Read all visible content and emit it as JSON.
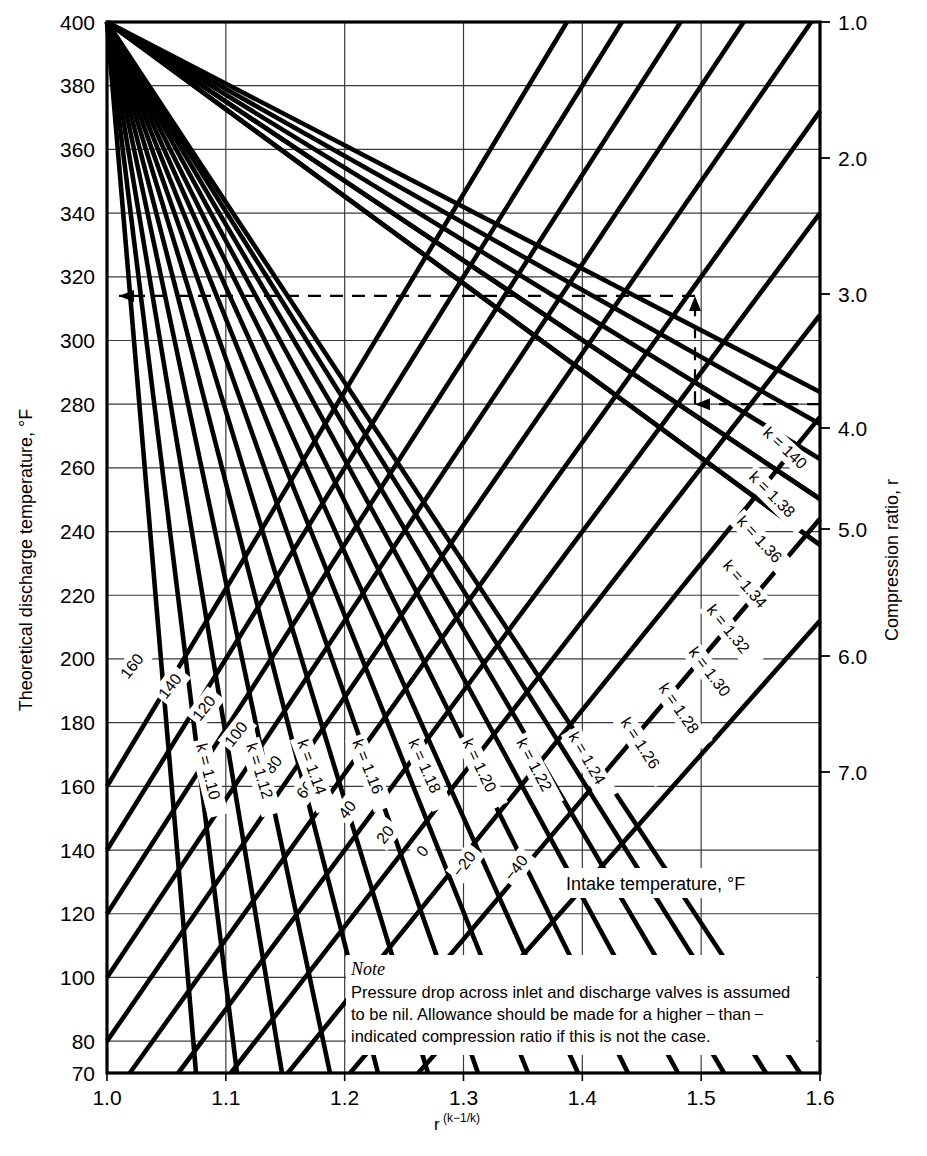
{
  "figure": {
    "kind": "nomograph",
    "background": "#ffffff",
    "line_color": "#000000",
    "grid_color": "#3a3a3a"
  },
  "axes": {
    "left": {
      "title": "Theoretical discharge temperature, °F",
      "ticks": [
        70,
        80,
        100,
        120,
        140,
        160,
        180,
        200,
        220,
        240,
        260,
        280,
        300,
        320,
        340,
        360,
        380,
        400
      ],
      "min": 70,
      "max": 400
    },
    "bottom": {
      "title_base": "r",
      "title_sup": "(k−1/k)",
      "ticks": [
        "1.0",
        "1.1",
        "1.2",
        "1.3",
        "1.4",
        "1.5",
        "1.6"
      ],
      "min": 1.0,
      "max": 1.6
    },
    "right": {
      "title": "Compression ratio, r",
      "ticks": [
        "1.0",
        "2.0",
        "3.0",
        "4.0",
        "5.0",
        "6.0",
        "7.0"
      ],
      "tick_values": [
        1.0,
        2.0,
        3.0,
        4.0,
        5.0,
        6.0,
        7.0
      ]
    }
  },
  "chart_data": {
    "type": "line",
    "xlabel": "r (k-1/k)",
    "ylabel": "Theoretical discharge temperature, °F",
    "xlim": [
      1.0,
      1.6
    ],
    "ylim": [
      70,
      400
    ],
    "grid": true,
    "legend": "inline curve labels",
    "k_lines": {
      "label_prefix": "k = ",
      "description": "Descending fan of k-lines converging at (1.0, 400) mapping r to r^((k-1)/k)",
      "series": [
        {
          "name": "k = 1.10",
          "k": 1.1,
          "label": "k = 1.10"
        },
        {
          "name": "k = 1.12",
          "k": 1.12,
          "label": "k = 1.12"
        },
        {
          "name": "k = 1.14",
          "k": 1.14,
          "label": "k = 1.14"
        },
        {
          "name": "k = 1.16",
          "k": 1.16,
          "label": "k = 1.16"
        },
        {
          "name": "k = 1.18",
          "k": 1.18,
          "label": "k = 1.18"
        },
        {
          "name": "k = 1.20",
          "k": 1.2,
          "label": "k = 1.20"
        },
        {
          "name": "k = 1.22",
          "k": 1.22,
          "label": "k = 1.22"
        },
        {
          "name": "k = 1.24",
          "k": 1.24,
          "label": "k = 1.24"
        },
        {
          "name": "k = 1.26",
          "k": 1.26,
          "label": "k = 1.26"
        },
        {
          "name": "k = 1.28",
          "k": 1.28,
          "label": "k = 1.28"
        },
        {
          "name": "k = 1.30",
          "k": 1.3,
          "label": "k = 1.30"
        },
        {
          "name": "k = 1.32",
          "k": 1.32,
          "label": "k = 1.32"
        },
        {
          "name": "k = 1.34",
          "k": 1.34,
          "label": "k = 1.34"
        },
        {
          "name": "k = 1.36",
          "k": 1.36,
          "label": "k = 1.36"
        },
        {
          "name": "k = 1.38",
          "k": 1.38,
          "label": "k = 1.38"
        },
        {
          "name": "k = 140",
          "k": 1.4,
          "label": "k = 140"
        }
      ]
    },
    "intake_lines": {
      "caption": "Intake temperature, °F",
      "description": "Ascending family of intake-temperature lines; discharge T = (intakeT + 460) * x - 460",
      "series": [
        {
          "name": "160",
          "intake_f": 160,
          "label": "160"
        },
        {
          "name": "140",
          "intake_f": 140,
          "label": "140"
        },
        {
          "name": "120",
          "intake_f": 120,
          "label": "120"
        },
        {
          "name": "100",
          "intake_f": 100,
          "label": "100"
        },
        {
          "name": "80",
          "intake_f": 80,
          "label": "80"
        },
        {
          "name": "60",
          "intake_f": 60,
          "label": "60"
        },
        {
          "name": "40",
          "intake_f": 40,
          "label": "40"
        },
        {
          "name": "20",
          "intake_f": 20,
          "label": "20"
        },
        {
          "name": "0",
          "intake_f": 0,
          "label": "0"
        },
        {
          "name": "-20",
          "intake_f": -20,
          "label": "−20"
        },
        {
          "name": "-40",
          "intake_f": -40,
          "label": "−40"
        }
      ]
    },
    "construction": {
      "description": "Dashed worked-example path: enter at compression ratio 4.0 on right axis, travel left to k-line, up to intake-temperature line, then left to read discharge temperature.",
      "compression_ratio_entry": 4.0,
      "discharge_temperature_result": 314,
      "intermediate_temperature": 280
    }
  },
  "note": {
    "heading": "Note",
    "line1": "Pressure drop across inlet and discharge valves is assumed",
    "line2": "to be nil.  Allowance should be made for a higher − than −",
    "line3": "indicated compression ratio if this is not the case."
  }
}
